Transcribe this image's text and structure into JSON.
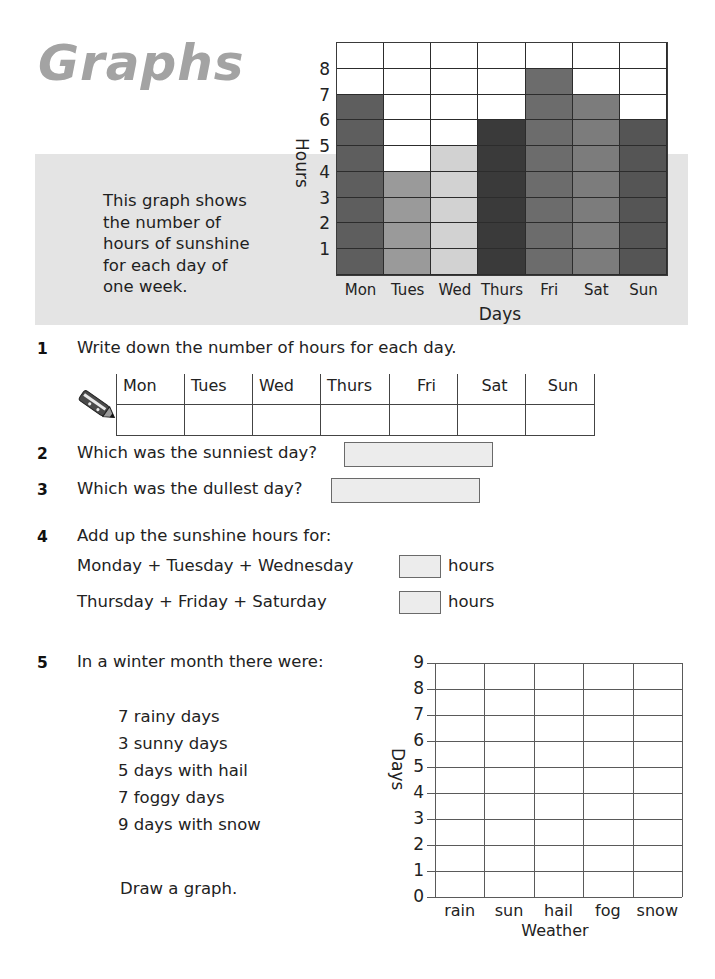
{
  "page": {
    "title": "Graphs",
    "panel_text_lines": [
      "This graph shows",
      "the number of",
      "hours of sunshine",
      "for each day of",
      "one week."
    ]
  },
  "chart_data": [
    {
      "type": "bar",
      "title": "Hours of sunshine for each day of one week",
      "categories": [
        "Mon",
        "Tues",
        "Wed",
        "Thurs",
        "Fri",
        "Sat",
        "Sun"
      ],
      "values": [
        7,
        4,
        5,
        6,
        8,
        7,
        6
      ],
      "bar_colors": [
        "#5e5e5e",
        "#9a9a9a",
        "#d2d2d2",
        "#3a3a3a",
        "#6c6c6c",
        "#7c7c7c",
        "#555555"
      ],
      "xlabel": "Days",
      "ylabel": "Hours",
      "yticks": [
        "1",
        "2",
        "3",
        "4",
        "5",
        "6",
        "7",
        "8"
      ],
      "ylim": [
        0,
        9
      ],
      "grid": true,
      "legend": "none"
    },
    {
      "type": "bar",
      "title": "Weather in a winter month (blank grid to complete)",
      "categories": [
        "rain",
        "sun",
        "hail",
        "fog",
        "snow"
      ],
      "values": [],
      "xlabel": "Weather",
      "ylabel": "Days",
      "yticks": [
        "0",
        "1",
        "2",
        "3",
        "4",
        "5",
        "6",
        "7",
        "8",
        "9"
      ],
      "ylim": [
        0,
        9
      ],
      "grid": true,
      "legend": "none"
    }
  ],
  "questions": {
    "q1": {
      "number": "1",
      "text": "Write down the number of hours for each day.",
      "table_headers": [
        "Mon",
        "Tues",
        "Wed",
        "Thurs",
        "Fri",
        "Sat",
        "Sun"
      ],
      "table_values": [
        "",
        "",
        "",
        "",
        "",
        "",
        ""
      ]
    },
    "q2": {
      "number": "2",
      "text": "Which was the sunniest day?",
      "answer": ""
    },
    "q3": {
      "number": "3",
      "text": "Which was the dullest day?",
      "answer": ""
    },
    "q4": {
      "number": "4",
      "text": "Add up the sunshine hours for:",
      "rows": [
        {
          "label": "Monday + Tuesday + Wednesday",
          "answer": "",
          "unit": "hours"
        },
        {
          "label": "Thursday + Friday + Saturday",
          "answer": "",
          "unit": "hours"
        }
      ]
    },
    "q5": {
      "number": "5",
      "text": "In a winter month there were:",
      "items": [
        "7 rainy days",
        "3 sunny days",
        "5 days with hail",
        "7 foggy days",
        "9 days with snow"
      ],
      "instruction": "Draw a graph."
    }
  },
  "icons": {
    "pencil": "pencil-icon"
  }
}
